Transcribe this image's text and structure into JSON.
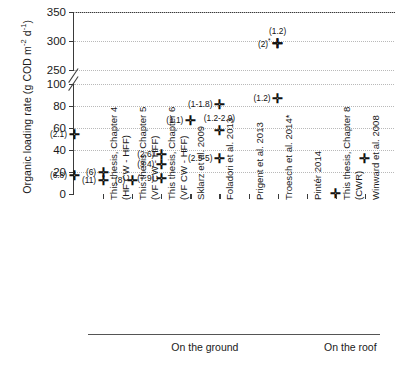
{
  "chart_data": {
    "type": "scatter",
    "title": "",
    "xlabel": "",
    "ylabel": "Organic loading rate (g COD m-2 d-1)",
    "ylabel_parts": {
      "main": "Organic loading rate (g COD m",
      "sup1": "-2",
      "mid": " d",
      "sup2": "-1",
      "end": ")"
    },
    "axis_broken": true,
    "break_note": "Y axis broken between 100 and 250",
    "y_lower_range": [
      0,
      100
    ],
    "y_upper_range": [
      250,
      350
    ],
    "y_lower_ticks": [
      0,
      20,
      40,
      60,
      80,
      100
    ],
    "y_upper_ticks": [
      250,
      300,
      350
    ],
    "grid": true,
    "legend": "none",
    "marker": "plus",
    "categories": [
      "This thesis, Chapter 4 (HF CW - HFF)",
      "This thesis, Chapter 5 (VF CW - HFF)",
      "This thesis, Chapter 6 (VF CW - HFF)",
      "Sklarz et al. 2009",
      "Foladori et al. 2013",
      "Prigent et al. 2013",
      "Troesch et al. 2014*",
      "Pinter 2014",
      "This thesis, Chapter 8 (CWR)",
      "Winward et al. 2008"
    ],
    "category_labels": [
      {
        "line1": "This thesis, Chapter 4",
        "line2": "(HF CW - HFF)"
      },
      {
        "line1": "This thesis, Chapter 5",
        "line2": "(VF CW - HFF)"
      },
      {
        "line1": "This thesis, Chapter 6",
        "line2": "(VF CW - HFF)"
      },
      {
        "line1": "Sklarz et al. 2009",
        "line2": ""
      },
      {
        "line1": "Foladori et al. 2013",
        "line2": ""
      },
      {
        "line1": "Prigent et al. 2013",
        "line2": ""
      },
      {
        "line1": "Troesch et al. 2014*",
        "line2": ""
      },
      {
        "line1": "Pintér 2014",
        "line2": ""
      },
      {
        "line1": "This thesis, Chapter 8",
        "line2": "(CWR)"
      },
      {
        "line1": "Winward et al. 2008",
        "line2": ""
      }
    ],
    "points": [
      {
        "category": "This thesis, Chapter 4 (HF CW - HFF)",
        "value": 20,
        "label": "(6)",
        "label_pos": "left"
      },
      {
        "category": "This thesis, Chapter 4 (HF CW - HFF)",
        "value": 13,
        "label": "(11)",
        "label_pos": "left"
      },
      {
        "category": "This thesis, Chapter 5 (VF CW - HFF)",
        "value": 13,
        "label": "(8)",
        "label_pos": "left"
      },
      {
        "category": "This thesis, Chapter 6 (VF CW - HFF)",
        "value": 36,
        "label": "(2.6)",
        "label_pos": "left"
      },
      {
        "category": "This thesis, Chapter 6 (VF CW - HFF)",
        "value": 27,
        "label": "(3.4)",
        "label_pos": "left"
      },
      {
        "category": "This thesis, Chapter 6 (VF CW - HFF)",
        "value": 15,
        "label": "(7.9)",
        "label_pos": "left"
      },
      {
        "category": "Sklarz et al. 2009",
        "value": 67,
        "label": "(1.1)",
        "label_pos": "left"
      },
      {
        "category": "Foladori et al. 2013",
        "value": 82,
        "label": "(1-1.8)",
        "label_pos": "left"
      },
      {
        "category": "Foladori et al. 2013",
        "value": 58,
        "label": "(1.2-2.9)",
        "label_pos": "above"
      },
      {
        "category": "Foladori et al. 2013",
        "value": 33,
        "label": "(2.5-5)",
        "label_pos": "left"
      },
      {
        "category": "Troesch et al. 2014*",
        "value": 297,
        "label": "(1.2)",
        "label_pos": "above"
      },
      {
        "category": "Troesch et al. 2014*",
        "value": 297,
        "label": "(2)*",
        "label_pos": "left"
      },
      {
        "category": "Troesch et al. 2014*",
        "value": 87,
        "label": "(1.2)",
        "label_pos": "left"
      },
      {
        "category": "Pintér 2014",
        "value": 55,
        "label": "(2.1)",
        "label_pos": "left"
      },
      {
        "category": "Pintér 2014",
        "value": 17,
        "label": "(6.8)",
        "label_pos": "left"
      },
      {
        "category": "This thesis, Chapter 8 (CWR)",
        "value": 0.5,
        "label": "",
        "label_pos": "left"
      },
      {
        "category": "Winward et al. 2008",
        "value": 33,
        "label": "",
        "label_pos": "left"
      }
    ],
    "groups": [
      {
        "label": "On the ground",
        "categories": 8
      },
      {
        "label": "On the roof",
        "categories": 2
      }
    ],
    "footnote_markers": [
      "*"
    ]
  }
}
